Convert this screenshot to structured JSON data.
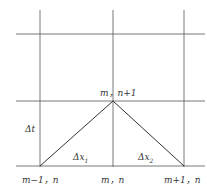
{
  "diagram": {
    "type": "finite-difference-stencil",
    "grid": {
      "vertical_x": [
        40,
        113,
        184
      ],
      "horizontal_y": [
        34,
        101,
        166
      ]
    },
    "labels": {
      "top_node": "m，n+1",
      "dt": "Δt",
      "dx1": "Δx",
      "dx1_sub": "1",
      "dx2": "Δx",
      "dx2_sub": "2",
      "left_node": "m−1，n",
      "mid_node": "m，n",
      "right_node": "m+1，n"
    },
    "colors": {
      "line": "#333333",
      "grid": "#555555"
    }
  }
}
